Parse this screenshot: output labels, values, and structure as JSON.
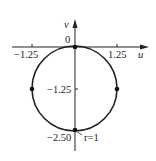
{
  "diagram": {
    "type": "circle-in-uv-plane",
    "axes": {
      "horizontal_label": "u",
      "vertical_label": "v",
      "origin_label": "0"
    },
    "ticks": {
      "u_left": "−1.25",
      "u_right": "1.25",
      "v_mid": "−1.25",
      "v_bottom": "−2.50"
    },
    "circle": {
      "center": [
        0,
        -1.25
      ],
      "radius": 1.25,
      "annotation": "r=1"
    },
    "points": [
      {
        "u": 0,
        "v": 0
      },
      {
        "u": -1.25,
        "v": -1.25
      },
      {
        "u": 1.25,
        "v": -1.25
      },
      {
        "u": 0,
        "v": -2.5
      }
    ],
    "colors": {
      "stroke": "#222222",
      "background": "#ffffff"
    }
  }
}
